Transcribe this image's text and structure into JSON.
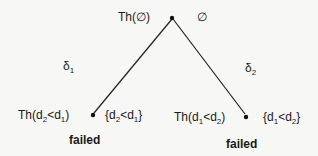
{
  "diagram": {
    "root": {
      "theory_label": "Th(∅)",
      "set_label": "∅"
    },
    "edges": [
      {
        "label_base": "δ",
        "label_sub": "1",
        "from": "root",
        "to": "left"
      },
      {
        "label_base": "δ",
        "label_sub": "2",
        "from": "root",
        "to": "right"
      }
    ],
    "left": {
      "theory": {
        "pre": "Th(d",
        "s1": "2",
        "mid": "<d",
        "s2": "1",
        "post": ")"
      },
      "set": {
        "pre": "{d",
        "s1": "2",
        "mid": "<d",
        "s2": "1",
        "post": "}"
      },
      "status": "failed"
    },
    "right": {
      "theory": {
        "pre": "Th(d",
        "s1": "1",
        "mid": "<d",
        "s2": "2",
        "post": ")"
      },
      "set": {
        "pre": "{d",
        "s1": "1",
        "mid": "<d",
        "s2": "2",
        "post": "}"
      },
      "status": "failed"
    },
    "colors": {
      "line": "#222222",
      "background": "#f7f7f5"
    }
  }
}
